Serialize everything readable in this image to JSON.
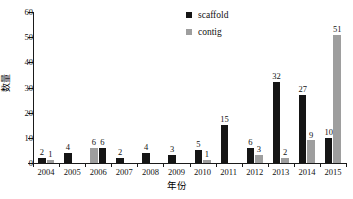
{
  "chart_data": {
    "type": "bar",
    "title": "",
    "subtitle": "",
    "xlabel": "年份",
    "ylabel": "数量",
    "ylim": [
      0,
      60
    ],
    "yticks": [
      0,
      10,
      20,
      30,
      40,
      50,
      60
    ],
    "ytick_labels": [
      "0",
      "10",
      "20",
      "30",
      "40",
      "50",
      "60"
    ],
    "grid": false,
    "legend_position": "top-center-right",
    "categories": [
      "2004",
      "2005",
      "2006",
      "2007",
      "2008",
      "2009",
      "2010",
      "2011",
      "2012",
      "2013",
      "2014",
      "2015"
    ],
    "series": [
      {
        "name": "scaffold",
        "color": "#151515",
        "values": [
          2,
          4,
          6,
          2,
          4,
          3,
          5,
          15,
          6,
          32,
          27,
          10
        ],
        "labels": [
          "2",
          "4",
          "6",
          "2",
          "4",
          "3",
          "5",
          "15",
          "6",
          "32",
          "27",
          "10"
        ]
      },
      {
        "name": "contig",
        "color": "#9e9e9e",
        "values": [
          1,
          0,
          6,
          0,
          0,
          0,
          1,
          0,
          3,
          2,
          9,
          51
        ],
        "labels": [
          "1",
          "",
          "6",
          "",
          "",
          "",
          "1",
          "",
          "3",
          "2",
          "9",
          "51"
        ]
      }
    ]
  },
  "legend": {
    "items": [
      {
        "label": "scaffold",
        "color": "#151515",
        "swatch": "square-marker-icon"
      },
      {
        "label": "contig",
        "color": "#9e9e9e",
        "swatch": "square-marker-icon"
      }
    ]
  },
  "axes": {
    "y_title": "数量",
    "x_title": "年份"
  }
}
